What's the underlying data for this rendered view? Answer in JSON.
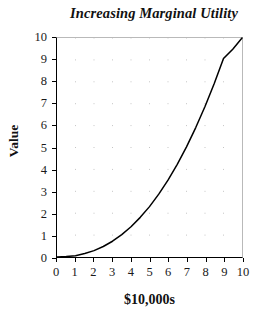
{
  "chart_data": {
    "type": "line",
    "title": "Increasing Marginal Utility",
    "xlabel": "$10,000s",
    "ylabel": "Value",
    "xlim": [
      0,
      10
    ],
    "ylim": [
      0,
      10
    ],
    "xticks": [
      "0",
      "1",
      "2",
      "3",
      "4",
      "5",
      "6",
      "7",
      "8",
      "9",
      "10"
    ],
    "yticks": [
      "0",
      "1",
      "2",
      "3",
      "4",
      "5",
      "6",
      "7",
      "8",
      "9",
      "10"
    ],
    "grid": "dotted",
    "legend": null,
    "series": [
      {
        "name": "Utility",
        "line_color": "#000000",
        "x": [
          0,
          0.5,
          1,
          1.5,
          2,
          2.5,
          3,
          3.5,
          4,
          4.5,
          5,
          5.5,
          6,
          6.5,
          7,
          7.5,
          8,
          8.5,
          9,
          9.5,
          10
        ],
        "values": [
          0,
          0.02,
          0.06,
          0.16,
          0.29,
          0.48,
          0.72,
          1.02,
          1.38,
          1.81,
          2.3,
          2.87,
          3.51,
          4.23,
          5.03,
          5.91,
          6.87,
          7.92,
          9.06,
          9.49,
          10
        ]
      }
    ]
  },
  "axes": {
    "y_title": "Value",
    "x_title": "$10,000s"
  }
}
